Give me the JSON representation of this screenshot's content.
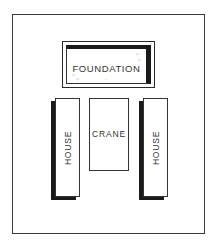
{
  "diagram": {
    "foundation": {
      "label": "FOUNDATION"
    },
    "crane": {
      "label": "CRANE"
    },
    "houses": [
      {
        "label": "HOUSE",
        "position": "left"
      },
      {
        "label": "HOUSE",
        "position": "right"
      }
    ]
  }
}
